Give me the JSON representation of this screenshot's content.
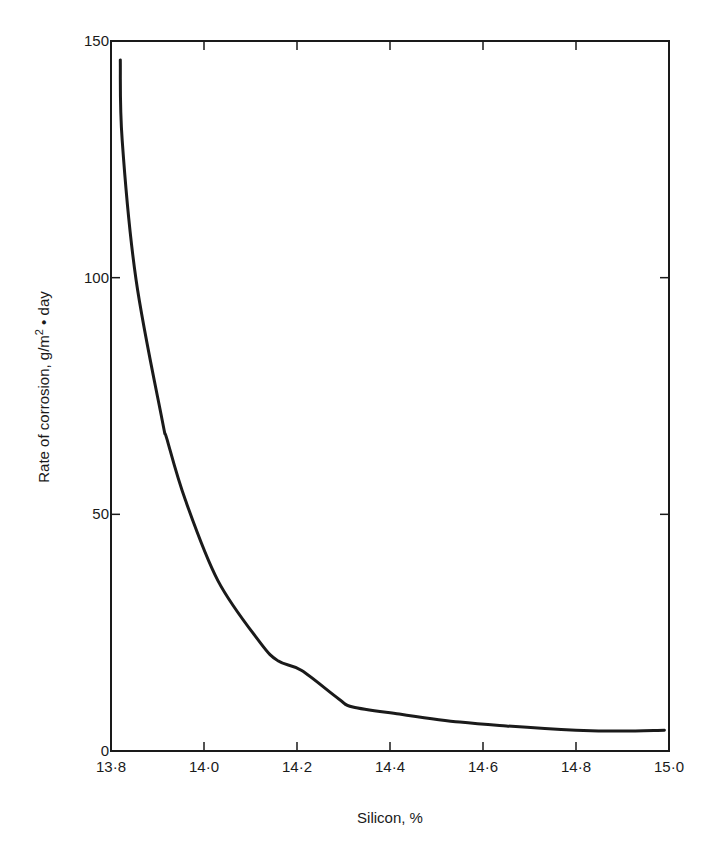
{
  "chart_data": {
    "type": "line",
    "title": "",
    "xlabel": "Silicon, %",
    "ylabel": "Rate of corrosion, g/m² • day",
    "ylabel_parts": {
      "main": "Rate of corrosion, g/m",
      "sup": "2",
      "tail": " • day"
    },
    "xlim": [
      13.8,
      15.0
    ],
    "ylim": [
      0,
      150
    ],
    "xticks": [
      13.8,
      14.0,
      14.2,
      14.4,
      14.6,
      14.8,
      15.0
    ],
    "xtick_labels": [
      "13·8",
      "14·0",
      "14·2",
      "14·4",
      "14·6",
      "14·8",
      "15·0"
    ],
    "yticks": [
      0,
      50,
      100,
      150
    ],
    "ytick_labels": [
      "0",
      "50",
      "100",
      "150"
    ],
    "grid": false,
    "legend": null,
    "frame": "box with inward ticks on all four sides",
    "series": [
      {
        "name": "Corrosion rate",
        "color": "#1a1a1a",
        "x": [
          13.82,
          13.824,
          13.854,
          13.91,
          13.92,
          13.96,
          14.03,
          14.12,
          14.16,
          14.21,
          14.29,
          14.32,
          14.42,
          14.55,
          14.65,
          14.8,
          14.9,
          14.99
        ],
        "y": [
          146,
          129,
          99.5,
          70,
          66,
          53,
          36,
          23,
          19,
          17,
          11,
          9.3,
          7.8,
          6.1,
          5.3,
          4.4,
          4.2,
          4.4
        ]
      }
    ]
  }
}
